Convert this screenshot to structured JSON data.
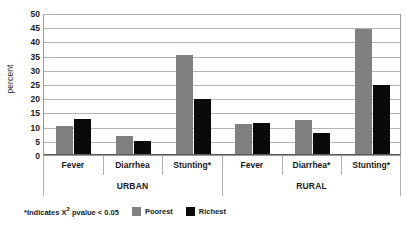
{
  "chart_data": {
    "type": "bar",
    "title": "",
    "subtitle": "",
    "xlabel": "",
    "ylabel": "percent",
    "ylim": [
      0,
      50
    ],
    "ytick_step": 5,
    "ytick_labels": [
      "0",
      "5",
      "10",
      "15",
      "20",
      "25",
      "30",
      "35",
      "40",
      "45",
      "50"
    ],
    "grid": true,
    "legend_position": "bottom",
    "categories": [
      "Fever",
      "Diarrhea",
      "Stunting*",
      "Fever",
      "Diarrhea*",
      "Stunting*"
    ],
    "group_labels": [
      "URBAN",
      "RURAL"
    ],
    "groups": [
      {
        "region": "URBAN",
        "categories": [
          "Fever",
          "Diarrhea",
          "Stunting*"
        ],
        "poorest": [
          10.2,
          6.8,
          35.3
        ],
        "richest": [
          12.8,
          5.0,
          19.6
        ]
      },
      {
        "region": "RURAL",
        "categories": [
          "Fever",
          "Diarrhea*",
          "Stunting*"
        ],
        "poorest": [
          10.8,
          12.2,
          44.3
        ],
        "richest": [
          11.3,
          7.7,
          24.7
        ]
      }
    ],
    "series": [
      {
        "name": "Poorest",
        "color": "#808080",
        "values": [
          10.2,
          6.8,
          35.3,
          10.8,
          12.2,
          44.3
        ]
      },
      {
        "name": "Richest",
        "color": "#0A0A0A",
        "values": [
          12.8,
          5.0,
          19.6,
          11.3,
          7.7,
          24.7
        ]
      }
    ],
    "annotations": [
      "*Indicates X² pvalue < 0.05"
    ]
  },
  "axis": {
    "y_title": "percent"
  },
  "footnote": {
    "prefix": "*Indicates X",
    "superscript": "2",
    "suffix": " pvalue < 0.05"
  },
  "legend": {
    "items": [
      {
        "label": "Poorest",
        "color": "#808080"
      },
      {
        "label": "Richest",
        "color": "#0A0A0A"
      }
    ]
  }
}
